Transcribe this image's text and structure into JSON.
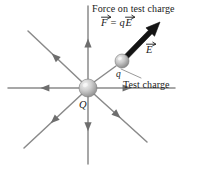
{
  "figure": {
    "background_color": "#ffffff",
    "width": 197,
    "height": 169
  },
  "labels": {
    "force_title": "Force on test charge",
    "formula": {
      "force_symbol": "F",
      "equals": "=",
      "scalar": "q",
      "field_symbol": "E",
      "plain": "F = qE"
    },
    "field_vector": "E",
    "test_charge_symbol": "q",
    "test_charge_caption": "Test charge",
    "source_charge_symbol": "Q"
  },
  "colors": {
    "field_line": "#8a8a8a",
    "field_arrowhead": "#6e6e6e",
    "force_arrow": "#141414",
    "sphere_light": "#e8e8e8",
    "sphere_mid": "#b6b6b6",
    "sphere_dark": "#7a7a7a",
    "text": "#1a1a1a",
    "leader_line": "#9a9a9a"
  },
  "charges": {
    "source": {
      "name": "Q",
      "cx": 88,
      "cy": 88,
      "r": 9,
      "sign": "positive"
    },
    "test": {
      "name": "q",
      "cx": 122,
      "cy": 61,
      "r": 7,
      "sign": "positive"
    }
  },
  "field_lines": [
    {
      "name": "up",
      "angle_deg": 90,
      "x1": 88,
      "y1": 80,
      "x2": 88,
      "y2": 6,
      "arrow_at": 0.56
    },
    {
      "name": "down",
      "angle_deg": 270,
      "x1": 88,
      "y1": 96,
      "x2": 88,
      "y2": 164,
      "arrow_at": 0.52
    },
    {
      "name": "left",
      "angle_deg": 180,
      "x1": 80,
      "y1": 88,
      "x2": 8,
      "y2": 88,
      "arrow_at": 0.55
    },
    {
      "name": "right",
      "angle_deg": 0,
      "x1": 96,
      "y1": 88,
      "x2": 175,
      "y2": 88,
      "arrow_at": 0.45
    },
    {
      "name": "upper-left",
      "angle_deg": 135,
      "x1": 82,
      "y1": 82,
      "x2": 28,
      "y2": 31,
      "arrow_at": 0.56
    },
    {
      "name": "lower-left",
      "angle_deg": 225,
      "x1": 82,
      "y1": 94,
      "x2": 24,
      "y2": 148,
      "arrow_at": 0.54
    },
    {
      "name": "lower-right",
      "angle_deg": 315,
      "x1": 94,
      "y1": 94,
      "x2": 147,
      "y2": 142,
      "arrow_at": 0.5
    },
    {
      "name": "upper-right",
      "angle_deg": 45,
      "x1": 94,
      "y1": 82,
      "x2": 116,
      "y2": 66,
      "arrow_at": 1.0
    }
  ],
  "force_arrow": {
    "name": "force-vector-on-test-charge",
    "x1": 126,
    "y1": 57,
    "x2": 160,
    "y2": 22,
    "width": 5,
    "head_length": 14,
    "head_width": 12
  },
  "leader_line": {
    "name": "test-charge-leader",
    "x1": 141,
    "y1": 78,
    "x2": 121,
    "y2": 69
  }
}
